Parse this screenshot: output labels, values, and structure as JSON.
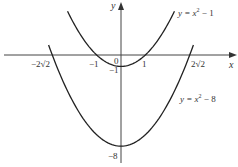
{
  "chart_data": {
    "type": "line",
    "title": "",
    "xlabel": "x",
    "ylabel": "y",
    "grid": false,
    "series": [
      {
        "name": "y = x^2 - 1",
        "label_text": "y = x² − 1",
        "formula": "x^2 - 1",
        "x_range": [
          -2.2,
          2.2
        ],
        "points": [
          [
            -2,
            3
          ],
          [
            -1,
            0
          ],
          [
            0,
            -1
          ],
          [
            1,
            0
          ],
          [
            2,
            3
          ]
        ],
        "vertex": [
          0,
          -1
        ],
        "x_intercepts": [
          -1,
          1
        ]
      },
      {
        "name": "y = x^2 - 8",
        "label_text": "y = x² − 8",
        "formula": "x^2 - 8",
        "x_range": [
          -2.98,
          2.98
        ],
        "points": [
          [
            -2.83,
            0
          ],
          [
            -2,
            -4
          ],
          [
            0,
            -8
          ],
          [
            2,
            -4
          ],
          [
            2.83,
            0
          ]
        ],
        "vertex": [
          0,
          -8
        ],
        "x_intercepts": [
          -2.83,
          2.83
        ]
      }
    ],
    "annotations": {
      "x_ticks": [
        {
          "value": -2.828,
          "label": "−2√2"
        },
        {
          "value": -1,
          "label": "−1"
        },
        {
          "value": 0,
          "label": "0"
        },
        {
          "value": 1,
          "label": "1"
        },
        {
          "value": 2.828,
          "label": "2√2"
        }
      ],
      "y_ticks": [
        {
          "value": -1,
          "label": "−1"
        },
        {
          "value": -8,
          "label": "−8"
        }
      ]
    }
  },
  "labels": {
    "x_axis": "x",
    "y_axis": "y",
    "origin": "0",
    "x_neg_2root2": "−2√2",
    "x_neg1": "−1",
    "x_pos1": "1",
    "x_pos_2root2": "2√2",
    "y_neg1": "−1",
    "y_neg8": "−8",
    "curve1_lhs": "y = x",
    "curve1_exp": "2",
    "curve1_rhs": " − 1",
    "curve2_lhs": "y = x",
    "curve2_exp": "2",
    "curve2_rhs": " − 8"
  },
  "colors": {
    "curve": "#222222",
    "axis": "#444444",
    "text": "#333333"
  }
}
